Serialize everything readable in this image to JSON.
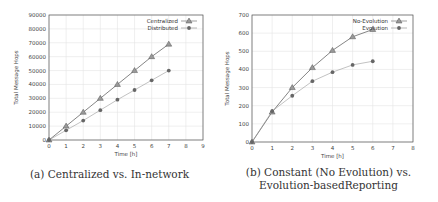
{
  "chart_data": [
    {
      "type": "line",
      "title": "",
      "caption": "(a) Centralized vs. In-network",
      "xlabel": "Time [h]",
      "ylabel": "Total Message Hops",
      "xlim": [
        0,
        9
      ],
      "ylim": [
        0,
        90000
      ],
      "xticks": [
        "0",
        "1",
        "2",
        "3",
        "4",
        "5",
        "6",
        "7",
        "8",
        "9"
      ],
      "yticks": [
        "0",
        "10000",
        "20000",
        "30000",
        "40000",
        "50000",
        "60000",
        "70000",
        "80000",
        "90000"
      ],
      "grid": true,
      "legend_position": "top-right",
      "x": [
        0,
        1,
        2,
        3,
        4,
        5,
        6,
        7
      ],
      "series": [
        {
          "name": "Centralized",
          "marker": "triangle",
          "values": [
            0,
            10000,
            20000,
            30000,
            40000,
            50000,
            60000,
            69000
          ]
        },
        {
          "name": "Distributed",
          "marker": "circle",
          "values": [
            0,
            7000,
            14000,
            21500,
            29000,
            36000,
            43000,
            50000
          ]
        }
      ]
    },
    {
      "type": "line",
      "title": "",
      "caption": "(b) Constant (No Evolution) vs. Evolution-basedReporting",
      "caption_line1": "(b) Constant (No Evolution) vs.",
      "caption_line2": "Evolution-basedReporting",
      "xlabel": "Time [h]",
      "ylabel": "Total Message Hops",
      "xlim": [
        0,
        8
      ],
      "ylim": [
        0,
        700
      ],
      "xticks": [
        "0",
        "1",
        "2",
        "3",
        "4",
        "5",
        "6",
        "7",
        "8"
      ],
      "yticks": [
        "0",
        "100",
        "200",
        "300",
        "400",
        "500",
        "600",
        "700"
      ],
      "grid": true,
      "legend_position": "top-right",
      "x": [
        0,
        1,
        2,
        3,
        4,
        5,
        6
      ],
      "series": [
        {
          "name": "No-Evolution",
          "marker": "triangle",
          "values": [
            0,
            165,
            300,
            410,
            505,
            580,
            620
          ]
        },
        {
          "name": "Evolution",
          "marker": "circle",
          "values": [
            0,
            170,
            255,
            335,
            385,
            425,
            445
          ]
        }
      ]
    }
  ],
  "colors": {
    "line_primary": "#777777",
    "line_secondary": "#999999",
    "marker": "#666666",
    "grid": "#e4e4e4",
    "axis": "#555555"
  }
}
